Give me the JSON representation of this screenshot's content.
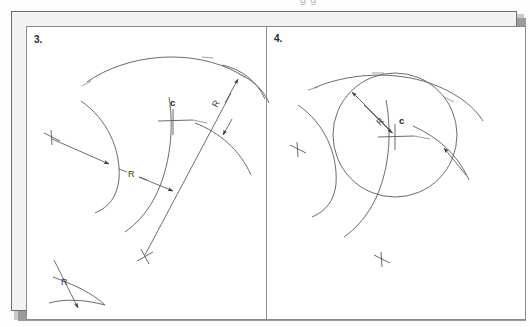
{
  "page": {
    "width": 530,
    "height": 327,
    "background_color": "#fdfdfd",
    "plate_background_color": "#ffffff",
    "frame_color": "#6e6e6e",
    "shadow_color": "#9b9b9b",
    "line_color": "#5a5a5a",
    "clipped_header_text": "g   g"
  },
  "panels": [
    {
      "id": "panel-3",
      "number_label": "3.",
      "title": "",
      "labels": [
        {
          "name": "radius-label-main",
          "text": "R",
          "x": 122,
          "y": 152
        },
        {
          "name": "radius-label-upper-right",
          "text": "R",
          "x": 203,
          "y": 90
        },
        {
          "name": "radius-label-lower-left",
          "text": "R",
          "x": 53,
          "y": 264
        },
        {
          "name": "center-label",
          "text": "c",
          "x": 156,
          "y": 96
        }
      ]
    },
    {
      "id": "panel-4",
      "number_label": "4.",
      "title": "",
      "labels": [
        {
          "name": "radius-label",
          "text": "R",
          "x": 357,
          "y": 96
        },
        {
          "name": "center-label",
          "text": "c",
          "x": 400,
          "y": 94
        }
      ]
    }
  ],
  "figure": {
    "type": "technical-drawing",
    "symbols": {
      "radius": "R",
      "center": "c"
    }
  }
}
